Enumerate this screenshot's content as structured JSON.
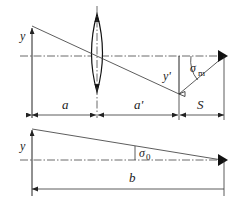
{
  "top_diagram": {
    "labels": {
      "object_height": "y",
      "image_height": "y'",
      "object_distance": "a",
      "image_distance": "a'",
      "screen_distance": "S",
      "angle_symbol": "σ",
      "angle_subscript": "m"
    }
  },
  "bottom_diagram": {
    "labels": {
      "object_height": "y",
      "distance": "b",
      "angle_symbol": "σ",
      "angle_subscript": "0"
    }
  }
}
